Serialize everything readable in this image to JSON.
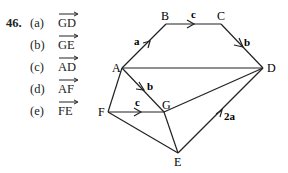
{
  "problem": {
    "number": "46.",
    "parts": [
      {
        "label": "(a)",
        "vector": "GD"
      },
      {
        "label": "(b)",
        "vector": "GE"
      },
      {
        "label": "(c)",
        "vector": "AD"
      },
      {
        "label": "(d)",
        "vector": "AF"
      },
      {
        "label": "(e)",
        "vector": "FE"
      }
    ]
  },
  "diagram": {
    "points": {
      "A": "A",
      "B": "B",
      "C": "C",
      "D": "D",
      "E": "E",
      "F": "F",
      "G": "G"
    },
    "vector_labels": {
      "AB": "a",
      "BC": "c",
      "CD": "b",
      "AG": "b",
      "FG": "c",
      "ED": "2a"
    }
  }
}
